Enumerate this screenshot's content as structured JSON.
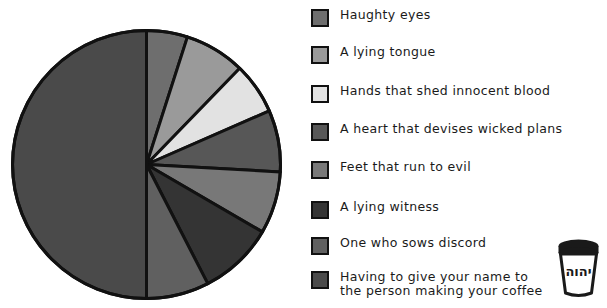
{
  "chart_data": {
    "type": "pie",
    "title": "",
    "subtitle": "",
    "xlabel": "",
    "ylabel": "",
    "legend_position": "right",
    "grid": false,
    "start_angle_deg": 0,
    "direction": "clockwise",
    "categories": [
      "Haughty eyes",
      "A lying tongue",
      "Hands that shed innocent blood",
      "A heart that devises wicked plans",
      "Feet that run to evil",
      "A lying witness",
      "One who sows discord",
      "Having to give your name to\nthe person making your coffee"
    ],
    "values": [
      4.9,
      7.3,
      6.2,
      7.4,
      7.5,
      9.1,
      7.6,
      50.0
    ],
    "angles_deg": [
      17.8,
      26.3,
      22.3,
      26.8,
      27.0,
      32.6,
      27.2,
      180.0
    ],
    "colors": [
      "#6e6e6e",
      "#9a9a9a",
      "#e2e2e2",
      "#575757",
      "#787878",
      "#343434",
      "#606060",
      "#4a4a4a"
    ],
    "stroke": "#111111",
    "stroke_width": 3
  },
  "legend": {
    "items": [
      {
        "label": "Haughty eyes",
        "color": "#6e6e6e"
      },
      {
        "label": "A lying tongue",
        "color": "#9a9a9a"
      },
      {
        "label": "Hands that shed innocent blood",
        "color": "#e2e2e2"
      },
      {
        "label": "A heart that devises wicked plans",
        "color": "#575757"
      },
      {
        "label": "Feet that run to evil",
        "color": "#787878"
      },
      {
        "label": "A lying witness",
        "color": "#343434"
      },
      {
        "label": "One who sows discord",
        "color": "#606060"
      },
      {
        "label": "Having to give your name to\nthe person making your coffee",
        "color": "#4a4a4a"
      }
    ]
  },
  "cup": {
    "text": "יהוה",
    "icon": "coffee-cup-icon"
  }
}
